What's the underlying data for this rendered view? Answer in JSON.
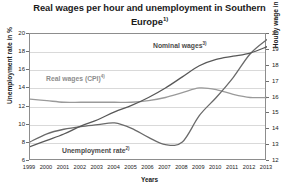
{
  "title": {
    "text": "Real wages per hour and unemployment in Southern Europe",
    "footnote_marker": "1)"
  },
  "axes": {
    "left_title": "Unemployment rate in %",
    "right_title": "Hourly wage in euros",
    "x_title": "Years",
    "left_ticks": [
      "20",
      "18",
      "16",
      "14",
      "12",
      "10",
      "8",
      "6"
    ],
    "right_ticks": [
      "20",
      "19",
      "18",
      "17",
      "16",
      "15",
      "14",
      "13",
      "12"
    ],
    "x_ticks": [
      "1999",
      "2000",
      "2001",
      "2002",
      "2003",
      "2004",
      "2005",
      "2006",
      "2007",
      "2008",
      "2009",
      "2010",
      "2011",
      "2012",
      "2013"
    ]
  },
  "labels": {
    "nominal": "Nominal wages",
    "nominal_marker": "3)",
    "real": "Real wages (CPI)",
    "real_marker": "4)",
    "unemployment": "Unemployment rate",
    "unemployment_marker": "2)"
  },
  "colors": {
    "nominal": "#585858",
    "real": "#9a9a9a",
    "unemployment": "#6a6a6a",
    "grid": "#d9d9d9",
    "frame": "#8d8d8d",
    "text": "#1b1b1b"
  },
  "chart_data": {
    "type": "line",
    "title": "Real wages per hour and unemployment in Southern Europe",
    "xlabel": "Years",
    "ylabel": "Unemployment rate in %",
    "y2label": "Hourly wage in euros",
    "grid": true,
    "legend": "inline-labels",
    "x": [
      1999,
      2000,
      2001,
      2002,
      2003,
      2004,
      2005,
      2006,
      2007,
      2008,
      2009,
      2010,
      2011,
      2012,
      2013
    ],
    "ylim": [
      6,
      20
    ],
    "y2lim": [
      12,
      20
    ],
    "series": [
      {
        "name": "Nominal wages",
        "axis": "right",
        "unit": "euros per hour",
        "values": [
          12.9,
          13.3,
          13.7,
          14.2,
          14.6,
          15.1,
          15.5,
          16.0,
          16.6,
          17.3,
          18.0,
          18.4,
          18.6,
          18.8,
          19.2
        ]
      },
      {
        "name": "Real wages (CPI)",
        "axis": "right",
        "unit": "euros per hour",
        "values": [
          15.9,
          15.8,
          15.7,
          15.7,
          15.7,
          15.7,
          15.7,
          15.8,
          16.0,
          16.3,
          16.6,
          16.5,
          16.2,
          16.0,
          16.0
        ]
      },
      {
        "name": "Unemployment rate",
        "axis": "left",
        "unit": "%",
        "values": [
          8.1,
          9.0,
          9.5,
          9.8,
          10.0,
          10.2,
          9.6,
          8.6,
          7.8,
          8.1,
          11.0,
          13.0,
          15.2,
          17.8,
          19.4
        ]
      }
    ]
  }
}
